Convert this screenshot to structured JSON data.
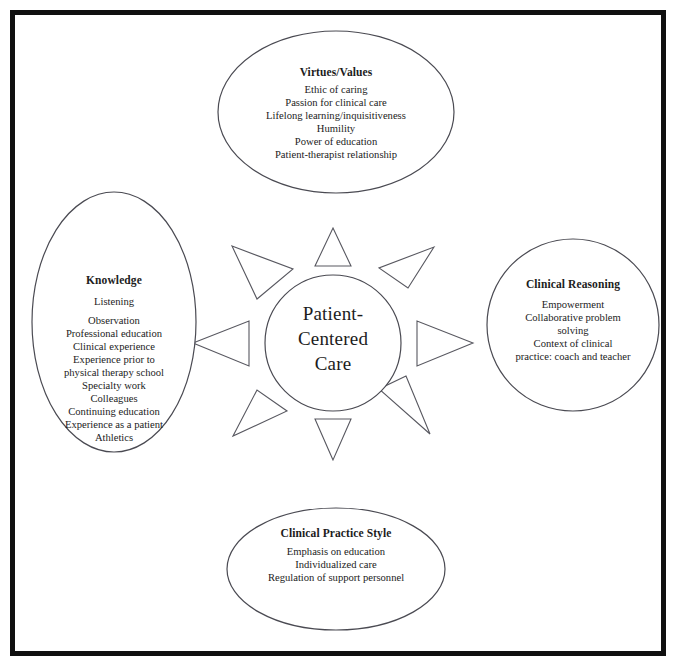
{
  "figure": {
    "name": "patient-centered-care-concept-map",
    "border_color": "#101010",
    "shape_stroke_color": "#4a4a52",
    "text_color": "#1c1c1c"
  },
  "hub": {
    "name": "Patient-Centered Care",
    "lines": [
      "Patient-",
      "Centered",
      "Care"
    ],
    "shape": "circle"
  },
  "nodes": {
    "top": {
      "title": "Virtues/Values",
      "shape": "ellipse",
      "items": [
        "Ethic of caring",
        "Passion for clinical care",
        "Lifelong learning/inquisitiveness",
        "Humility",
        "Power of education",
        "Patient-therapist relationship"
      ]
    },
    "left": {
      "title": "Knowledge",
      "shape": "ellipse",
      "items": [
        "Listening",
        "Observation",
        "Professional education",
        "Clinical experience",
        "Experience prior to",
        "physical therapy school",
        "Specialty work",
        "Colleagues",
        "Continuing education",
        "Experience as a patient",
        "Athletics"
      ]
    },
    "right": {
      "title": "Clinical Reasoning",
      "shape": "circle",
      "items": [
        "Empowerment",
        "Collaborative problem",
        "solving",
        "Context of clinical",
        "practice:  coach and teacher"
      ]
    },
    "bottom": {
      "title": "Clinical Practice Style",
      "shape": "ellipse",
      "items": [
        "Emphasis on education",
        "Individualized care",
        "Regulation of support personnel"
      ]
    }
  },
  "arrows": {
    "count": 8,
    "directions": [
      "north",
      "northeast",
      "east",
      "southeast",
      "south",
      "southwest",
      "west",
      "northwest"
    ]
  }
}
